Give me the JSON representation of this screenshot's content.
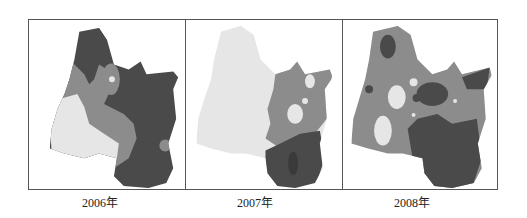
{
  "figure": {
    "panels": [
      {
        "year_label": "2006年",
        "dominant_shade": "dark",
        "colors": {
          "light": "#e6e6e6",
          "mid": "#8c8c8c",
          "dark": "#4a4a4a"
        }
      },
      {
        "year_label": "2007年",
        "dominant_shade": "light",
        "colors": {
          "light": "#e6e6e6",
          "mid": "#8c8c8c",
          "dark": "#4a4a4a"
        }
      },
      {
        "year_label": "2008年",
        "dominant_shade": "mid",
        "colors": {
          "light": "#e6e6e6",
          "mid": "#8c8c8c",
          "dark": "#4a4a4a"
        }
      }
    ]
  }
}
